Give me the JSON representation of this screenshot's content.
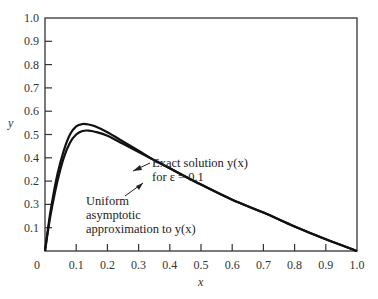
{
  "chart_data": {
    "type": "line",
    "title": "",
    "xlabel": "x",
    "ylabel": "y",
    "xlim": [
      0,
      1.0
    ],
    "ylim": [
      0,
      1.0
    ],
    "grid": false,
    "legend": "none (inline annotations with arrows)",
    "x_ticks": [
      "0",
      "0.1",
      "0.2",
      "0.3",
      "0.4",
      "0.5",
      "0.6",
      "0.7",
      "0.8",
      "0.9",
      "1.0"
    ],
    "y_tick_labels_bottom_to_top": [
      "0.1",
      "0.3",
      "0.2",
      "0.4",
      "0.5",
      "0.6",
      "0.7",
      "0.8",
      "0.9",
      "1.0"
    ],
    "x": [
      0,
      0.01,
      0.02,
      0.04,
      0.06,
      0.08,
      0.1,
      0.12,
      0.14,
      0.16,
      0.2,
      0.25,
      0.3,
      0.35,
      0.4,
      0.5,
      0.6,
      0.7,
      0.8,
      0.9,
      1.0
    ],
    "series": [
      {
        "name": "Exact solution y(x) for ε = 0.1",
        "values": [
          0,
          0.1,
          0.19,
          0.33,
          0.43,
          0.5,
          0.535,
          0.545,
          0.543,
          0.535,
          0.51,
          0.47,
          0.43,
          0.39,
          0.355,
          0.285,
          0.22,
          0.165,
          0.105,
          0.05,
          0
        ]
      },
      {
        "name": "Uniform asymptotic approximation to y(x)",
        "values": [
          0,
          0.09,
          0.17,
          0.3,
          0.4,
          0.465,
          0.5,
          0.515,
          0.517,
          0.512,
          0.495,
          0.46,
          0.425,
          0.39,
          0.355,
          0.285,
          0.22,
          0.165,
          0.105,
          0.05,
          0
        ]
      }
    ],
    "annotations": [
      {
        "text_line1": "Exact solution y(x)",
        "text_line2": "for ε = 0.1",
        "points_to": "upper curve near x≈0.27"
      },
      {
        "text_line1": "Uniform",
        "text_line2": "asymptotic",
        "text_line3": "approximation to y(x)",
        "points_to": "lower curve near x≈0.28"
      }
    ]
  },
  "labels": {
    "x_axis": "x",
    "y_axis": "y",
    "ann1_l1": "Exact solution y(x)",
    "ann1_l2": "for ε = 0.1",
    "ann2_l1": "Uniform",
    "ann2_l2": "asymptotic",
    "ann2_l3": "approximation to y(x)"
  }
}
